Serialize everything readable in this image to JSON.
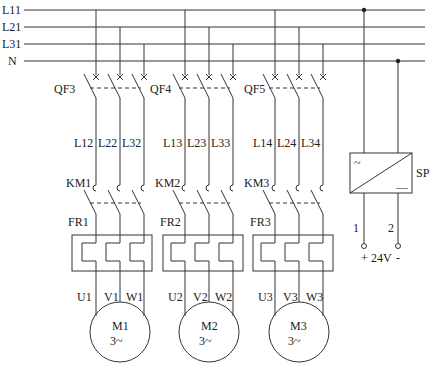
{
  "buses": [
    {
      "label": "L11",
      "y": 10
    },
    {
      "label": "L21",
      "y": 27
    },
    {
      "label": "L31",
      "y": 44
    },
    {
      "label": "N",
      "y": 61
    }
  ],
  "branches": [
    {
      "breaker": "QF3",
      "wires": [
        "L12",
        "L22",
        "L32"
      ],
      "contactor": "KM1",
      "relay": "FR1",
      "terminals": [
        "U1",
        "V1",
        "W1"
      ],
      "motor": "M1",
      "motor_type": "3~"
    },
    {
      "breaker": "QF4",
      "wires": [
        "L13",
        "L23",
        "L33"
      ],
      "contactor": "KM2",
      "relay": "FR2",
      "terminals": [
        "U2",
        "V2",
        "W2"
      ],
      "motor": "M2",
      "motor_type": "3~"
    },
    {
      "breaker": "QF5",
      "wires": [
        "L14",
        "L24",
        "L34"
      ],
      "contactor": "KM3",
      "relay": "FR3",
      "terminals": [
        "U3",
        "V3",
        "W3"
      ],
      "motor": "M3",
      "motor_type": "3~"
    }
  ],
  "power_supply": {
    "label": "SP",
    "input_symbol": "~",
    "output_symbol": "—",
    "terminals": [
      "1",
      "2"
    ],
    "plus": "+",
    "voltage": "24V",
    "minus": "-"
  }
}
